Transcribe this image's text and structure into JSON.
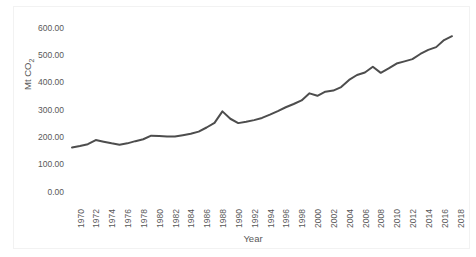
{
  "chart_data": {
    "type": "line",
    "title": "",
    "xlabel": "Year",
    "ylabel": "Mt CO2",
    "ylabel_html": "Mt CO₂",
    "x": [
      1970,
      1971,
      1972,
      1973,
      1974,
      1975,
      1976,
      1977,
      1978,
      1979,
      1980,
      1981,
      1982,
      1983,
      1984,
      1985,
      1986,
      1987,
      1988,
      1989,
      1990,
      1991,
      1992,
      1993,
      1994,
      1995,
      1996,
      1997,
      1998,
      1999,
      2000,
      2001,
      2002,
      2003,
      2004,
      2005,
      2006,
      2007,
      2008,
      2009,
      2010,
      2011,
      2012,
      2013,
      2014,
      2015,
      2016,
      2017,
      2018
    ],
    "values": [
      163.0,
      170.0,
      175.0,
      180.0,
      190.0,
      182.0,
      173.0,
      172.0,
      180.0,
      190.0,
      198.0,
      200.0,
      199.0,
      200.0,
      203.0,
      208.0,
      214.0,
      222.0,
      240.0,
      260.0,
      296.0,
      268.0,
      252.0,
      253.0,
      261.0,
      268.0,
      282.0,
      292.0,
      303.0,
      315.0,
      329.0,
      337.0,
      347.0,
      345.0,
      361.0,
      358.0,
      366.0,
      372.0,
      374.0,
      391.0,
      412.0,
      428.0,
      437.0,
      449.0,
      459.0,
      437.0,
      447.0,
      462.0,
      470.0
    ],
    "values_tail": [
      480.0,
      493.0,
      500.0,
      517.0,
      534.0,
      540.0,
      552.0,
      575.0,
      568.0
    ],
    "series": [
      {
        "name": "CO2 emissions",
        "points": [
          {
            "year": 1970,
            "value": 163.0
          },
          {
            "year": 1971,
            "value": 168.0
          },
          {
            "year": 1972,
            "value": 175.0
          },
          {
            "year": 1973,
            "value": 190.0
          },
          {
            "year": 1974,
            "value": 184.0
          },
          {
            "year": 1975,
            "value": 178.0
          },
          {
            "year": 1976,
            "value": 173.0
          },
          {
            "year": 1977,
            "value": 178.0
          },
          {
            "year": 1978,
            "value": 186.0
          },
          {
            "year": 1979,
            "value": 193.0
          },
          {
            "year": 1980,
            "value": 206.0
          },
          {
            "year": 1981,
            "value": 205.0
          },
          {
            "year": 1982,
            "value": 203.0
          },
          {
            "year": 1983,
            "value": 203.0
          },
          {
            "year": 1984,
            "value": 208.0
          },
          {
            "year": 1985,
            "value": 213.0
          },
          {
            "year": 1986,
            "value": 221.0
          },
          {
            "year": 1987,
            "value": 236.0
          },
          {
            "year": 1988,
            "value": 253.0
          },
          {
            "year": 1989,
            "value": 295.0
          },
          {
            "year": 1990,
            "value": 268.0
          },
          {
            "year": 1991,
            "value": 252.0
          },
          {
            "year": 1992,
            "value": 257.0
          },
          {
            "year": 1993,
            "value": 263.0
          },
          {
            "year": 1994,
            "value": 271.0
          },
          {
            "year": 1995,
            "value": 283.0
          },
          {
            "year": 1996,
            "value": 296.0
          },
          {
            "year": 1997,
            "value": 310.0
          },
          {
            "year": 1998,
            "value": 322.0
          },
          {
            "year": 1999,
            "value": 335.0
          },
          {
            "year": 2000,
            "value": 361.0
          },
          {
            "year": 2001,
            "value": 352.0
          },
          {
            "year": 2002,
            "value": 367.0
          },
          {
            "year": 2003,
            "value": 371.0
          },
          {
            "year": 2004,
            "value": 384.0
          },
          {
            "year": 2005,
            "value": 410.0
          },
          {
            "year": 2006,
            "value": 428.0
          },
          {
            "year": 2007,
            "value": 437.0
          },
          {
            "year": 2008,
            "value": 458.0
          },
          {
            "year": 2009,
            "value": 436.0
          },
          {
            "year": 2010,
            "value": 452.0
          },
          {
            "year": 2011,
            "value": 470.0
          },
          {
            "year": 2012,
            "value": 478.0
          },
          {
            "year": 2013,
            "value": 486.0
          },
          {
            "year": 2014,
            "value": 505.0
          },
          {
            "year": 2015,
            "value": 520.0
          },
          {
            "year": 2016,
            "value": 530.0
          },
          {
            "year": 2017,
            "value": 556.0
          },
          {
            "year": 2018,
            "value": 570.0
          }
        ]
      }
    ],
    "xlim": [
      1970,
      2018
    ],
    "ylim": [
      0,
      600
    ],
    "ytick_labels": [
      "600.00",
      "500.00",
      "400.00",
      "300.00",
      "200.00",
      "100.00",
      "0.00"
    ],
    "ytick_values": [
      600,
      500,
      400,
      300,
      200,
      100,
      0
    ],
    "xtick_labels": [
      "1970",
      "1972",
      "1974",
      "1976",
      "1978",
      "1980",
      "1982",
      "1984",
      "1986",
      "1988",
      "1990",
      "1992",
      "1994",
      "1996",
      "1998",
      "2000",
      "2002",
      "2004",
      "2006",
      "2008",
      "2010",
      "2012",
      "2014",
      "2016",
      "2018"
    ],
    "xtick_values": [
      1970,
      1972,
      1974,
      1976,
      1978,
      1980,
      1982,
      1984,
      1986,
      1988,
      1990,
      1992,
      1994,
      1996,
      1998,
      2000,
      2002,
      2004,
      2006,
      2008,
      2010,
      2012,
      2014,
      2016,
      2018
    ],
    "grid": false,
    "legend": "none",
    "line_color": "#4d4d4d",
    "line_width": 2,
    "axis_color": "#d9d9d9",
    "text_color": "#595959",
    "background": "#ffffff"
  }
}
